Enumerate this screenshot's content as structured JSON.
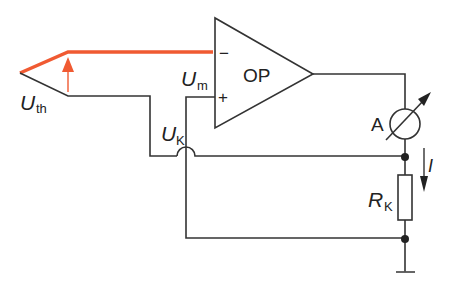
{
  "diagram": {
    "type": "circuit-schematic",
    "colors": {
      "wire": "#333333",
      "thermocouple_hot": "#f05a32",
      "background": "#ffffff"
    },
    "labels": {
      "opamp": "OP",
      "opamp_minus": "−",
      "opamp_plus": "+",
      "uth_main": "U",
      "uth_sub": "th",
      "um_main": "U",
      "um_sub": "m",
      "uk_main": "U",
      "uk_sub": "K",
      "ammeter": "A",
      "current": "I",
      "rk_main": "R",
      "rk_sub": "K"
    },
    "components": [
      {
        "id": "thermocouple",
        "label": "U_th"
      },
      {
        "id": "opamp",
        "label": "OP"
      },
      {
        "id": "ammeter",
        "label": "A"
      },
      {
        "id": "resistor",
        "label": "R_K"
      },
      {
        "id": "ground"
      }
    ]
  }
}
